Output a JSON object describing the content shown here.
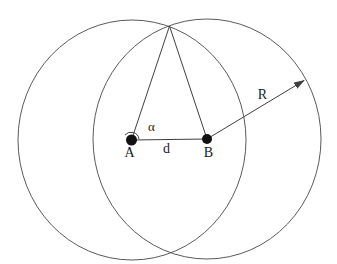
{
  "diagram": {
    "labels": {
      "point_a": "A",
      "point_b": "B",
      "distance": "d",
      "angle": "α",
      "radius": "R"
    },
    "colors": {
      "background": "#ffffff",
      "circle_stroke": "#5a5a5a",
      "line_stroke": "#3f3f3f",
      "dot_fill": "#111111",
      "text": "#1a1a1a"
    }
  }
}
